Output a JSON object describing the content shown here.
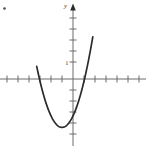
{
  "figure": {
    "width": 146,
    "height": 146,
    "background_color": "#ffffff",
    "curve_color": "#2b2b2b",
    "axis_color": "#6b6b6b",
    "label_color": "#3a3a3a"
  },
  "labels": {
    "y_axis_label": "y",
    "y_unit_tick_label": "1"
  },
  "marks": {
    "corner_dot_name": "corner-speck"
  },
  "chart_data": {
    "type": "line",
    "title": "",
    "subtitle": "",
    "xlabel": "",
    "ylabel": "y",
    "curve_label": "upward-opening parabola",
    "xlim": [
      -6.6,
      6.6
    ],
    "ylim": [
      -6.1,
      6.7
    ],
    "grid": false,
    "legend": null,
    "axis_arrows": [
      "y-axis-top"
    ],
    "tick_spacing_units": 1,
    "tick_labels_x": [],
    "tick_labels_y": [
      "1"
    ],
    "vertex": [
      -1.0,
      -4.4
    ],
    "roots": [
      -3.1,
      1.15
    ],
    "y_intercept": -3.6,
    "leading_coefficient": 1.05,
    "equation": "y = 1.05(x + 1)^2 - 4.4",
    "x": [
      -3.3,
      -3.0,
      -2.7,
      -2.4,
      -2.1,
      -1.8,
      -1.5,
      -1.2,
      -0.9,
      -0.6,
      -0.3,
      0.0,
      0.3,
      0.6,
      0.9,
      1.2,
      1.5,
      1.8
    ],
    "values": [
      0.91,
      -0.18,
      -1.01,
      -1.64,
      -3.06,
      -3.71,
      -4.14,
      -4.36,
      -4.39,
      -4.23,
      -3.88,
      -3.35,
      -2.62,
      -1.7,
      -0.59,
      0.71,
      2.21,
      3.9
    ],
    "series": [
      {
        "name": "parabola",
        "x": [
          -3.3,
          -3.0,
          -2.7,
          -2.4,
          -2.1,
          -1.8,
          -1.5,
          -1.2,
          -0.9,
          -0.6,
          -0.3,
          0.0,
          0.3,
          0.6,
          0.9,
          1.2,
          1.5,
          1.8
        ],
        "values": [
          0.91,
          -0.18,
          -1.01,
          -1.64,
          -3.06,
          -3.71,
          -4.14,
          -4.36,
          -4.39,
          -4.23,
          -3.88,
          -3.35,
          -2.62,
          -1.7,
          -0.59,
          0.71,
          2.21,
          3.9
        ]
      }
    ]
  }
}
